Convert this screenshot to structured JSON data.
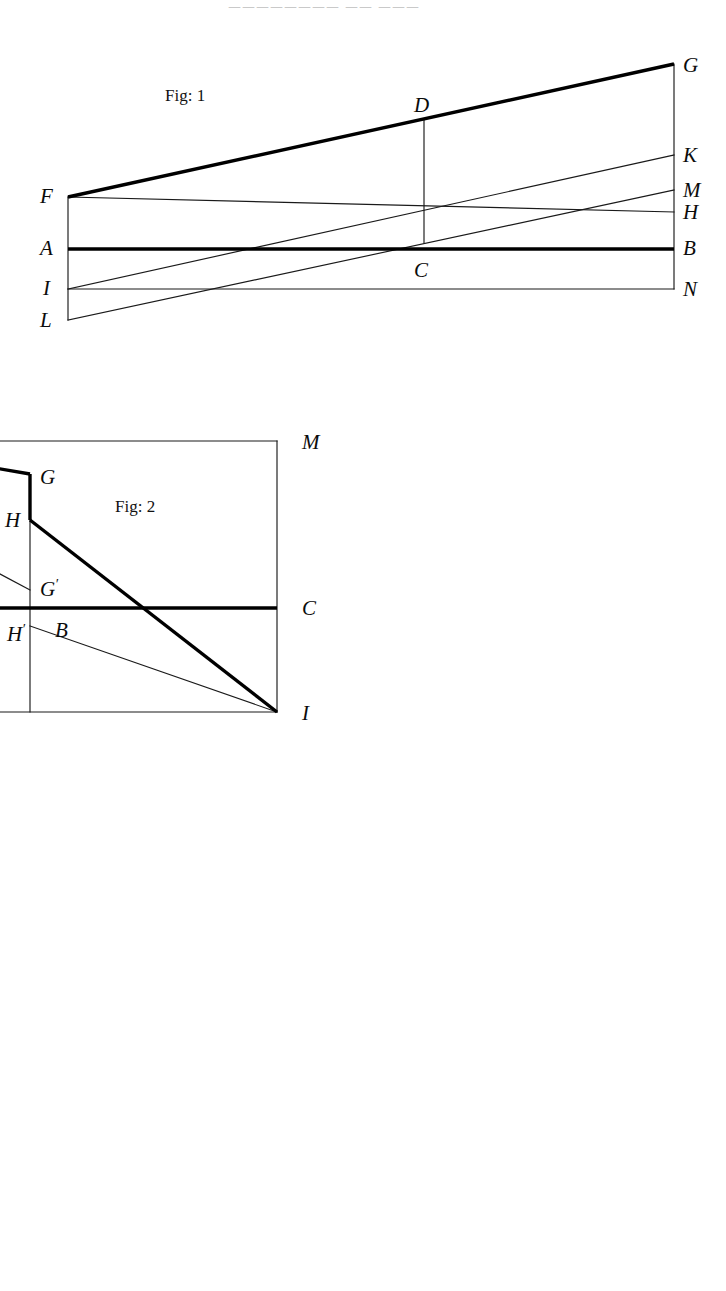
{
  "page": {
    "width": 726,
    "height": 1291,
    "background": "#ffffff",
    "ink": "#000000",
    "header_faint_text": "二二二二二二二二  二二  二二二"
  },
  "figures": [
    {
      "id": "fig1",
      "caption": "Fig: 1",
      "caption_pos": {
        "x": 165,
        "y": 101
      },
      "viewbox": "0 0 726 345",
      "top": 40,
      "description": "Trapezoidal pencil of lines from left vertical edge F-A-I-L to right vertical edge G-K-M-H-B-N with vertical chord D-C",
      "labels": [
        {
          "text": "G",
          "x": 683,
          "y": 72,
          "prime": ""
        },
        {
          "text": "D",
          "x": 414,
          "y": 112,
          "prime": ""
        },
        {
          "text": "K",
          "x": 683,
          "y": 162,
          "prime": ""
        },
        {
          "text": "F",
          "x": 40,
          "y": 203,
          "prime": ""
        },
        {
          "text": "M",
          "x": 683,
          "y": 197,
          "prime": ""
        },
        {
          "text": "H",
          "x": 683,
          "y": 219,
          "prime": ""
        },
        {
          "text": "A",
          "x": 40,
          "y": 255,
          "prime": ""
        },
        {
          "text": "B",
          "x": 683,
          "y": 255,
          "prime": ""
        },
        {
          "text": "C",
          "x": 414,
          "y": 277,
          "prime": ""
        },
        {
          "text": "I",
          "x": 43,
          "y": 295,
          "prime": ""
        },
        {
          "text": "N",
          "x": 683,
          "y": 296,
          "prime": ""
        },
        {
          "text": "L",
          "x": 40,
          "y": 327,
          "prime": ""
        }
      ],
      "points": {
        "F": [
          68,
          197
        ],
        "A": [
          68,
          249
        ],
        "I": [
          68,
          289
        ],
        "L": [
          68,
          320
        ],
        "G": [
          674,
          64
        ],
        "K": [
          674,
          155
        ],
        "M": [
          674,
          190
        ],
        "H": [
          674,
          212
        ],
        "B": [
          674,
          249
        ],
        "N": [
          674,
          289
        ],
        "D": [
          424,
          119
        ],
        "C": [
          424,
          243
        ]
      },
      "segments_thick": [
        {
          "name": "FG",
          "from": "F",
          "to": "G"
        },
        {
          "name": "AB",
          "from": "A",
          "to": "B"
        }
      ],
      "segments_thin": [
        {
          "name": "F-left-edge",
          "from": "F",
          "to": "L"
        },
        {
          "name": "G-right-edge",
          "from": "G",
          "to": "N"
        },
        {
          "name": "FH",
          "from": "F",
          "to": "H"
        },
        {
          "name": "IK",
          "from": "I",
          "to": "K"
        },
        {
          "name": "LM",
          "from": "L",
          "to": "M"
        },
        {
          "name": "IN",
          "from": "I",
          "to": "N"
        },
        {
          "name": "DC",
          "from": "D",
          "to": "C"
        }
      ]
    },
    {
      "id": "fig2",
      "caption": "Fig: 2",
      "caption_pos": {
        "x": 500,
        "y": 512
      },
      "viewbox": "0 0 726 340",
      "top": 395,
      "description": "Rectangle L-M-K-(right) with descending thick stepped path F-N-G then H-I, chord F-G' and H'-I, axis A-C and vertical N-O-H'",
      "labels": [
        {
          "text": "F",
          "x": 42,
          "y": 412,
          "prime": ""
        },
        {
          "text": "N",
          "x": 216,
          "y": 425,
          "prime": ""
        },
        {
          "text": "L",
          "x": 42,
          "y": 449,
          "prime": ""
        },
        {
          "text": "M",
          "x": 687,
          "y": 449,
          "prime": ""
        },
        {
          "text": "G",
          "x": 425,
          "y": 484,
          "prime": ""
        },
        {
          "text": "H",
          "x": 390,
          "y": 527,
          "prime": ""
        },
        {
          "text": "G",
          "x": 425,
          "y": 596,
          "prime": "′"
        },
        {
          "text": "A",
          "x": 42,
          "y": 615,
          "prime": ""
        },
        {
          "text": "C",
          "x": 687,
          "y": 615,
          "prime": ""
        },
        {
          "text": "O",
          "x": 215,
          "y": 637,
          "prime": ""
        },
        {
          "text": "H",
          "x": 392,
          "y": 641,
          "prime": "′"
        },
        {
          "text": "B",
          "x": 440,
          "y": 637,
          "prime": ""
        },
        {
          "text": "K",
          "x": 42,
          "y": 718,
          "prime": ""
        },
        {
          "text": "I",
          "x": 687,
          "y": 720,
          "prime": ""
        }
      ],
      "points": {
        "F": [
          63,
          402
        ],
        "L": [
          63,
          441
        ],
        "A": [
          63,
          608
        ],
        "K": [
          63,
          712
        ],
        "M": [
          662,
          441
        ],
        "C": [
          662,
          608
        ],
        "I": [
          662,
          712
        ],
        "N": [
          222,
          441
        ],
        "O": [
          222,
          608
        ],
        "G": [
          415,
          474
        ],
        "H": [
          415,
          520
        ],
        "Gp": [
          415,
          590
        ],
        "Hp": [
          415,
          626
        ]
      },
      "segments_thick": [
        {
          "name": "FN",
          "from": "F",
          "to": "N"
        },
        {
          "name": "NG",
          "from": "N",
          "to": "G"
        },
        {
          "name": "G-step",
          "from": "G",
          "to": "H"
        },
        {
          "name": "HI",
          "from": "H",
          "to": "I"
        },
        {
          "name": "AC",
          "from": "A",
          "to": "C"
        }
      ],
      "segments_thin": [
        {
          "name": "LM",
          "from": "L",
          "to": "M"
        },
        {
          "name": "KI",
          "from": "K",
          "to": "I"
        },
        {
          "name": "left-edge",
          "from": "F",
          "to": "K"
        },
        {
          "name": "right-edge",
          "from": "M",
          "to": "I"
        },
        {
          "name": "FGp",
          "from": "F",
          "to": "Gp"
        },
        {
          "name": "HpI",
          "from": "Hp",
          "to": "I"
        },
        {
          "name": "NO-vertical",
          "from": "N",
          "to": "O"
        },
        {
          "name": "GpHp-vertical",
          "from": "Gp",
          "to": "Hp"
        },
        {
          "name": "H-vertical-down",
          "from": "H",
          "to": "Hp"
        },
        {
          "name": "Hp-vertical-bottom",
          "from": "Hp",
          "to": "Hpb"
        }
      ]
    },
    {
      "id": "fig3",
      "caption": "Fig: 3",
      "caption_pos": {
        "x": 260,
        "y": 921
      },
      "viewbox": "0 0 726 500",
      "top": 795,
      "description": "Grid rectangle R-L / N-O with two ascending thick staircase ramps F-G / H-W-I-K-L and many auxiliary verticals",
      "labels": [
        {
          "text": "R",
          "x": 42,
          "y": 825,
          "prime": ""
        },
        {
          "text": "V",
          "x": 560,
          "y": 808,
          "prime": ""
        },
        {
          "text": "L",
          "x": 688,
          "y": 822,
          "prime": ""
        },
        {
          "text": "P",
          "x": 42,
          "y": 852,
          "prime": ""
        },
        {
          "text": "U",
          "x": 560,
          "y": 840,
          "prime": ""
        },
        {
          "text": "Q",
          "x": 688,
          "y": 853,
          "prime": ""
        },
        {
          "text": "G",
          "x": 214,
          "y": 868,
          "prime": ""
        },
        {
          "text": "K",
          "x": 445,
          "y": 872,
          "prime": ""
        },
        {
          "text": "Y",
          "x": 586,
          "y": 880,
          "prime": "″"
        },
        {
          "text": "K",
          "x": 688,
          "y": 894,
          "prime": "′"
        },
        {
          "text": "Y",
          "x": 121,
          "y": 903,
          "prime": ""
        },
        {
          "text": "I",
          "x": 480,
          "y": 929,
          "prime": ""
        },
        {
          "text": "F",
          "x": 42,
          "y": 972,
          "prime": ""
        },
        {
          "text": "F",
          "x": 214,
          "y": 973,
          "prime": "′"
        },
        {
          "text": "X",
          "x": 283,
          "y": 973,
          "prime": "′"
        },
        {
          "text": "W",
          "x": 388,
          "y": 973,
          "prime": ""
        },
        {
          "text": "F",
          "x": 478,
          "y": 973,
          "prime": "″"
        },
        {
          "text": "X",
          "x": 586,
          "y": 973,
          "prime": "″"
        },
        {
          "text": "M",
          "x": 688,
          "y": 1000,
          "prime": ""
        },
        {
          "text": "X",
          "x": 126,
          "y": 1027,
          "prime": ""
        },
        {
          "text": "A",
          "x": 42,
          "y": 1077,
          "prime": ""
        },
        {
          "text": "D",
          "x": 688,
          "y": 1077,
          "prime": ""
        },
        {
          "text": "B",
          "x": 182,
          "y": 1100,
          "prime": ""
        },
        {
          "text": "Z",
          "x": 408,
          "y": 1099,
          "prime": ""
        },
        {
          "text": "C",
          "x": 444,
          "y": 1099,
          "prime": ""
        },
        {
          "text": "S",
          "x": 586,
          "y": 1099,
          "prime": ""
        },
        {
          "text": "Y",
          "x": 300,
          "y": 1141,
          "prime": "′"
        },
        {
          "text": "H",
          "x": 182,
          "y": 1257,
          "prime": ""
        },
        {
          "text": "H",
          "x": 478,
          "y": 1257,
          "prime": "′"
        },
        {
          "text": "T",
          "x": 586,
          "y": 1257,
          "prime": ""
        },
        {
          "text": "N",
          "x": 42,
          "y": 1278,
          "prime": ""
        },
        {
          "text": "O",
          "x": 688,
          "y": 1281,
          "prime": ""
        }
      ],
      "points": {
        "R": [
          62,
          818
        ],
        "P": [
          62,
          843
        ],
        "F": [
          62,
          1003
        ],
        "A": [
          62,
          1093
        ],
        "N": [
          62,
          1272
        ],
        "L": [
          665,
          812
        ],
        "Q": [
          665,
          845
        ],
        "Kp": [
          665,
          883
        ],
        "M": [
          665,
          1003
        ],
        "D": [
          665,
          1093
        ],
        "O": [
          665,
          1272
        ],
        "G": [
          207,
          843
        ],
        "B": [
          207,
          1093
        ],
        "H": [
          207,
          1272
        ],
        "Xv": [
          140,
          1003
        ],
        "Y": [
          140,
          912
        ],
        "Xpv": [
          310,
          1003
        ],
        "Yp": [
          310,
          1130
        ],
        "W": [
          413,
          1003
        ],
        "Z": [
          413,
          1093
        ],
        "K": [
          468,
          883
        ],
        "I": [
          468,
          945
        ],
        "C": [
          468,
          1093
        ],
        "Hp": [
          468,
          1272
        ],
        "V": [
          575,
          812
        ],
        "U": [
          575,
          845
        ],
        "Ypp": [
          575,
          883
        ],
        "Xpp": [
          575,
          1003
        ],
        "S": [
          575,
          1093
        ],
        "T": [
          575,
          1272
        ]
      },
      "segments_thick": [
        {
          "name": "FG-ramp",
          "from": "F",
          "to": "G"
        },
        {
          "name": "G-vertical",
          "from": "G",
          "to": "H"
        },
        {
          "name": "HW-ramp",
          "from": "H",
          "to": "I"
        },
        {
          "name": "I-vertical",
          "from": "I",
          "to": "K"
        },
        {
          "name": "KL-ramp",
          "from": "K",
          "to": "L"
        },
        {
          "name": "AD-axis",
          "from": "A",
          "to": "D"
        }
      ],
      "segments_thin": [
        {
          "name": "RL-top",
          "from": "R",
          "to": "L"
        },
        {
          "name": "PQ",
          "from": "P",
          "to": "Q"
        },
        {
          "name": "KKp",
          "from": "Kleft",
          "to": "Kp"
        },
        {
          "name": "FM",
          "from": "F",
          "to": "M"
        },
        {
          "name": "NO-bottom",
          "from": "N",
          "to": "O"
        },
        {
          "name": "left-edge",
          "from": "R",
          "to": "N"
        },
        {
          "name": "right-edge",
          "from": "L",
          "to": "O"
        },
        {
          "name": "X-vertical",
          "from": "Y",
          "to": "Xv"
        },
        {
          "name": "Xp-vertical",
          "from": "Xpv",
          "to": "Yp-bottom"
        },
        {
          "name": "W-vertical",
          "from": "W",
          "to": "Z"
        },
        {
          "name": "C-vertical",
          "from": "C",
          "to": "Hp"
        },
        {
          "name": "V-vertical",
          "from": "V",
          "to": "T"
        }
      ]
    }
  ]
}
